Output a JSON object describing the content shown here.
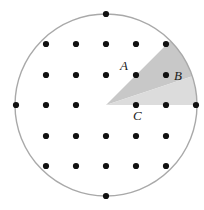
{
  "figure": {
    "canvas": {
      "width": 204,
      "height": 210,
      "background": "#ffffff"
    },
    "circle": {
      "name": "boundary-circle",
      "cx": 106,
      "cy": 105,
      "r": 91,
      "stroke": "#a9a9a9",
      "stroke_width": 1.4,
      "fill": "none"
    },
    "wedges": [
      {
        "name": "dark-wedge",
        "fill": "#c8c8c8",
        "apex": [
          106,
          105
        ],
        "start_angle_deg": 45,
        "end_angle_deg": 18.43,
        "through_points": [
          "A",
          "B"
        ]
      },
      {
        "name": "light-wedge",
        "fill": "#dcdcdc",
        "apex": [
          106,
          105
        ],
        "start_angle_deg": 18.43,
        "end_angle_deg": 0,
        "through_points": [
          "B",
          "C"
        ]
      }
    ],
    "dot_style": {
      "r": 3.1,
      "fill": "#111111"
    },
    "dots": [
      {
        "name": "dot-top",
        "x": 106,
        "y": 14
      },
      {
        "name": "dot-r1c1",
        "x": 46,
        "y": 44
      },
      {
        "name": "dot-r1c2",
        "x": 76,
        "y": 44
      },
      {
        "name": "dot-r1c3",
        "x": 106,
        "y": 44
      },
      {
        "name": "dot-r1c4",
        "x": 136,
        "y": 44
      },
      {
        "name": "dot-r1c5",
        "x": 166,
        "y": 44
      },
      {
        "name": "dot-r2c1",
        "x": 46,
        "y": 75
      },
      {
        "name": "dot-r2c2",
        "x": 76,
        "y": 75
      },
      {
        "name": "dot-r2c3",
        "x": 106,
        "y": 75
      },
      {
        "name": "dot-a",
        "x": 136,
        "y": 75
      },
      {
        "name": "dot-b",
        "x": 166,
        "y": 75
      },
      {
        "name": "dot-r3c0",
        "x": 16,
        "y": 105
      },
      {
        "name": "dot-r3c1",
        "x": 46,
        "y": 105
      },
      {
        "name": "dot-r3c2",
        "x": 76,
        "y": 105
      },
      {
        "name": "dot-c",
        "x": 136,
        "y": 105
      },
      {
        "name": "dot-r3c5",
        "x": 166,
        "y": 105
      },
      {
        "name": "dot-r3c6",
        "x": 196,
        "y": 105
      },
      {
        "name": "dot-r4c1",
        "x": 46,
        "y": 136
      },
      {
        "name": "dot-r4c2",
        "x": 76,
        "y": 136
      },
      {
        "name": "dot-r4c3",
        "x": 106,
        "y": 136
      },
      {
        "name": "dot-r4c4",
        "x": 136,
        "y": 136
      },
      {
        "name": "dot-r4c5",
        "x": 166,
        "y": 136
      },
      {
        "name": "dot-r5c1",
        "x": 46,
        "y": 166
      },
      {
        "name": "dot-r5c2",
        "x": 76,
        "y": 166
      },
      {
        "name": "dot-r5c3",
        "x": 106,
        "y": 166
      },
      {
        "name": "dot-r5c4",
        "x": 136,
        "y": 166
      },
      {
        "name": "dot-r5c5",
        "x": 166,
        "y": 166
      },
      {
        "name": "dot-bottom",
        "x": 106,
        "y": 196
      }
    ],
    "labels": [
      {
        "name": "label-a",
        "text": "A",
        "x": 128,
        "y": 70,
        "anchor": "end"
      },
      {
        "name": "label-b",
        "text": "B",
        "x": 174,
        "y": 80,
        "anchor": "start"
      },
      {
        "name": "label-c",
        "text": "C",
        "x": 133,
        "y": 120,
        "anchor": "start"
      }
    ]
  }
}
